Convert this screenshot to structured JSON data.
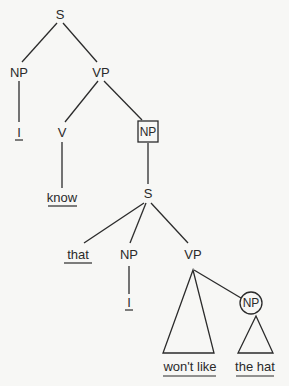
{
  "tree": {
    "root": {
      "label": "S"
    },
    "np_subject": {
      "label": "NP"
    },
    "vp_main": {
      "label": "VP"
    },
    "pronoun_1": {
      "label": "I"
    },
    "verb": {
      "label": "V"
    },
    "np_boxed": {
      "label": "NP",
      "marker": "box"
    },
    "verb_word": {
      "label": "know"
    },
    "s_embedded": {
      "label": "S"
    },
    "complementizer": {
      "label": "that"
    },
    "np_embedded_subject": {
      "label": "NP"
    },
    "vp_embedded": {
      "label": "VP"
    },
    "pronoun_2": {
      "label": "I"
    },
    "vp_words": {
      "label": "won't like",
      "marker": "triangle"
    },
    "np_circled": {
      "label": "NP",
      "marker": "circle"
    },
    "np_circled_words": {
      "label": "the hat",
      "marker": "triangle"
    }
  },
  "colors": {
    "background": "#f7f7f5",
    "ink": "#2b2b2b"
  }
}
